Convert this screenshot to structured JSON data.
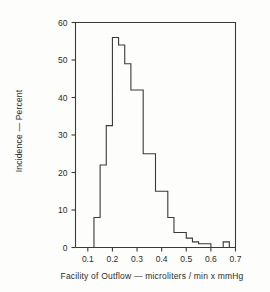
{
  "chart_data": {
    "type": "bar",
    "title": "",
    "subtitle": "",
    "xlabel": "Facility of Outflow   —   microliters / min   x   mmHg",
    "ylabel": "Incidence — Percent",
    "xlim": [
      0.05,
      0.7
    ],
    "ylim": [
      0,
      60
    ],
    "grid": false,
    "legend": null,
    "bin_width": 0.025,
    "x_tick_values": [
      0.1,
      0.2,
      0.3,
      0.4,
      0.5,
      0.6,
      0.7
    ],
    "x_tick_labels": [
      "0.1",
      "0.2",
      "0.3",
      "0.4",
      "0.5",
      "0.6",
      "0.7"
    ],
    "y_tick_values": [
      0,
      10,
      20,
      30,
      40,
      50,
      60
    ],
    "y_tick_labels": [
      "0",
      "10",
      "20",
      "30",
      "40",
      "50",
      "60"
    ],
    "bin_starts": [
      0.125,
      0.15,
      0.175,
      0.2,
      0.225,
      0.25,
      0.275,
      0.3,
      0.325,
      0.35,
      0.375,
      0.4,
      0.425,
      0.45,
      0.475,
      0.5,
      0.525,
      0.55,
      0.575,
      0.6,
      0.625,
      0.65,
      0.675
    ],
    "values": [
      8,
      22,
      32.5,
      56,
      54,
      49,
      42,
      42,
      25,
      25,
      15,
      15,
      8,
      4,
      4,
      2.5,
      1.5,
      1,
      1,
      0,
      0,
      1.5,
      0
    ],
    "categories": [
      "0.125",
      "0.150",
      "0.175",
      "0.200",
      "0.225",
      "0.250",
      "0.275",
      "0.300",
      "0.325",
      "0.350",
      "0.375",
      "0.400",
      "0.425",
      "0.450",
      "0.475",
      "0.500",
      "0.525",
      "0.550",
      "0.575",
      "0.600",
      "0.625",
      "0.650",
      "0.675"
    ],
    "peak_value": 56,
    "peak_bin": "0.200",
    "colors": {
      "line": "#3a3a3a",
      "background": "#fdfdfb",
      "text": "#2b2b2b"
    }
  },
  "axis": {
    "x_title": "Facility of Outflow   —   microliters / min   x   mmHg",
    "y_title": "Incidence — Percent"
  }
}
